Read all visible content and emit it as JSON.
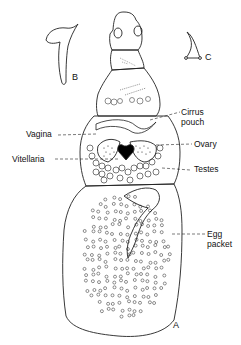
{
  "figure": {
    "panel_labels": {
      "a": "A",
      "b": "B",
      "c": "C"
    },
    "labels": {
      "cirrus_pouch_line1": "Cirrus",
      "cirrus_pouch_line2": "pouch",
      "vagina": "Vagina",
      "ovary": "Ovary",
      "vitellaria": "Vitellaria",
      "testes": "Testes",
      "egg_packet_line1": "Egg",
      "egg_packet_line2": "packet"
    },
    "colors": {
      "ink": "#111111",
      "background": "#ffffff"
    }
  }
}
